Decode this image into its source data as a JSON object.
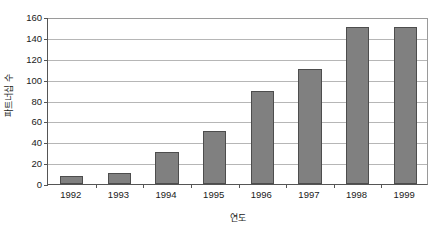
{
  "chart_data": {
    "type": "bar",
    "title": "",
    "subtitle": "",
    "xlabel": "연도",
    "ylabel": "파트너십 수",
    "categories": [
      "1992",
      "1993",
      "1994",
      "1995",
      "1996",
      "1997",
      "1998",
      "1999"
    ],
    "values": [
      8,
      11,
      31,
      51,
      89,
      110,
      150,
      150
    ],
    "series": [
      {
        "name": "파트너십 수",
        "values": [
          8,
          11,
          31,
          51,
          89,
          110,
          150,
          150
        ]
      }
    ],
    "ylim": [
      0,
      160
    ],
    "ytick_values": [
      0,
      20,
      40,
      60,
      80,
      100,
      120,
      140,
      160
    ],
    "ytick_labels": [
      "0",
      "20",
      "40",
      "60",
      "80",
      "100",
      "120",
      "140",
      "160"
    ],
    "xtick_labels": [
      "1992",
      "1993",
      "1994",
      "1995",
      "1996",
      "1997",
      "1998",
      "1999"
    ],
    "grid": true,
    "grid_axis": "y",
    "legend": false,
    "legend_position": "none",
    "annotations": [],
    "colors": {
      "bar_fill": "#808080",
      "bar_border": "#4d4d4d",
      "gridline": "#b6b6b6",
      "axis": "#555555",
      "background": "#ffffff",
      "text": "#1a1a1a"
    }
  }
}
